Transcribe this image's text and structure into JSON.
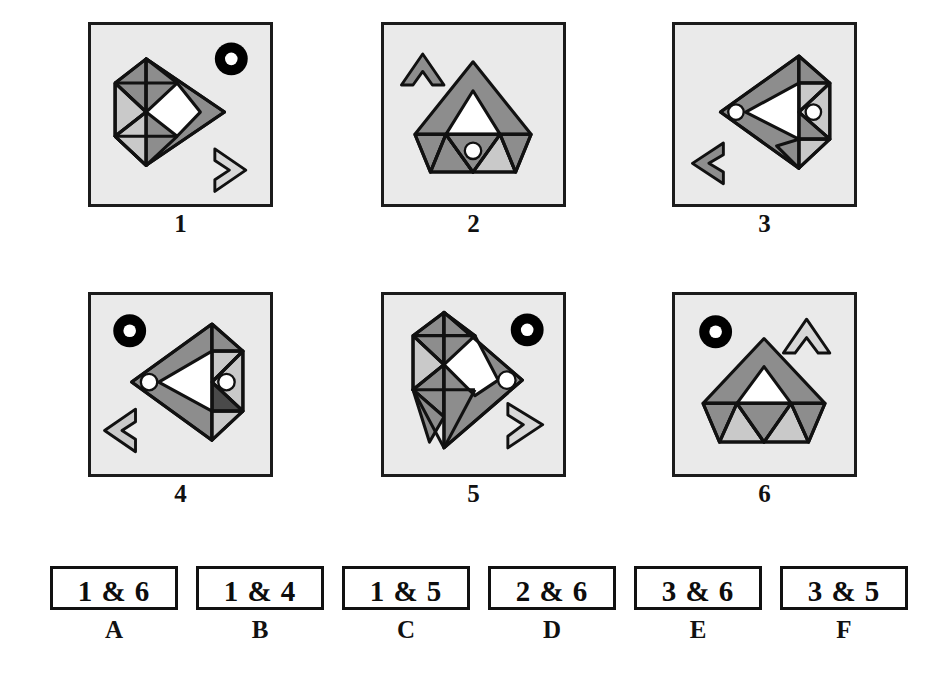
{
  "page": {
    "kind": "visual-analogy-figure-matching-test",
    "background": "#ffffff",
    "panel_background": "#eaeaea",
    "panel_border": "#1b1b1b"
  },
  "palette": {
    "outline": "#111111",
    "dark_gray": "#6f6f6f",
    "mid_gray": "#8d8d8d",
    "light_gray": "#c9c9c9",
    "pale_gray": "#d8d8d8",
    "very_dark_gray": "#4a4a4a",
    "white": "#ffffff",
    "black": "#000000",
    "panel_fill": "#eaeaea"
  },
  "figures": [
    {
      "id": "figure-1",
      "label": "1",
      "facing": "right",
      "body": "diamond-right",
      "eye": "none",
      "loose_marker": "black-ring-top-right",
      "loose_chevron": "pale-chevron-right-bottom-right"
    },
    {
      "id": "figure-2",
      "label": "2",
      "facing": "up",
      "body": "hexagon-up",
      "eye": "white-dot-center-lower",
      "loose_marker": "none",
      "loose_chevron": "mid-gray-chevron-up-top-left"
    },
    {
      "id": "figure-3",
      "label": "3",
      "facing": "left",
      "body": "diamond-left",
      "eye": "white-dot-left-tip and white-dot-inner",
      "loose_marker": "none",
      "loose_chevron": "mid-gray-chevron-left-bottom-left"
    },
    {
      "id": "figure-4",
      "label": "4",
      "facing": "left",
      "body": "diamond-left",
      "eye": "white-dot-left-tip and white-dot-inner-on-dark",
      "loose_marker": "black-ring-top-left",
      "loose_chevron": "light-gray-chevron-left-bottom-left"
    },
    {
      "id": "figure-5",
      "label": "5",
      "facing": "right",
      "body": "diamond-right",
      "eye": "white-dot-right-tip",
      "loose_marker": "black-ring-top-right",
      "loose_chevron": "pale-chevron-right-bottom-right"
    },
    {
      "id": "figure-6",
      "label": "6",
      "facing": "up",
      "body": "hexagon-up",
      "eye": "none",
      "loose_marker": "black-ring-top-left",
      "loose_chevron": "pale-chevron-up-top-right"
    }
  ],
  "answers": [
    {
      "letter": "A",
      "text": "1 & 6"
    },
    {
      "letter": "B",
      "text": "1 & 4"
    },
    {
      "letter": "C",
      "text": "1 & 5"
    },
    {
      "letter": "D",
      "text": "2 & 6"
    },
    {
      "letter": "E",
      "text": "3 & 6"
    },
    {
      "letter": "F",
      "text": "3 & 5"
    }
  ]
}
